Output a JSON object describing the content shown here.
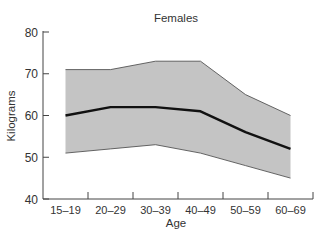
{
  "chart_data": {
    "type": "area",
    "title": "Females",
    "xlabel": "Age",
    "ylabel": "Kilograms",
    "categories": [
      "15–19",
      "20–29",
      "30–39",
      "40–49",
      "50–59",
      "60–69"
    ],
    "ylim": [
      40,
      80
    ],
    "yticks": [
      40,
      50,
      60,
      70,
      80
    ],
    "grid": false,
    "legend": "none",
    "series": [
      {
        "name": "Upper range",
        "values": [
          71,
          71,
          73,
          73,
          65,
          60
        ]
      },
      {
        "name": "Average",
        "values": [
          60,
          62,
          62,
          61,
          56,
          52
        ]
      },
      {
        "name": "Lower range",
        "values": [
          51,
          52,
          53,
          51,
          48,
          45
        ]
      }
    ],
    "colors": {
      "band_fill": "#c4c4c4",
      "band_edge": "#555555",
      "mean_line": "#111111",
      "axis": "#444444"
    }
  }
}
